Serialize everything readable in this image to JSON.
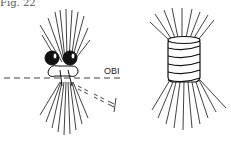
{
  "figure": {
    "label": "Fig. 22",
    "annotation": "OBI",
    "panels": [
      {
        "name": "knot-with-obi-line",
        "description": "Bundle tied with two loops, dashed OBI line"
      },
      {
        "name": "wrapped-binding",
        "description": "Bundle wrapped with coiled band"
      }
    ]
  }
}
